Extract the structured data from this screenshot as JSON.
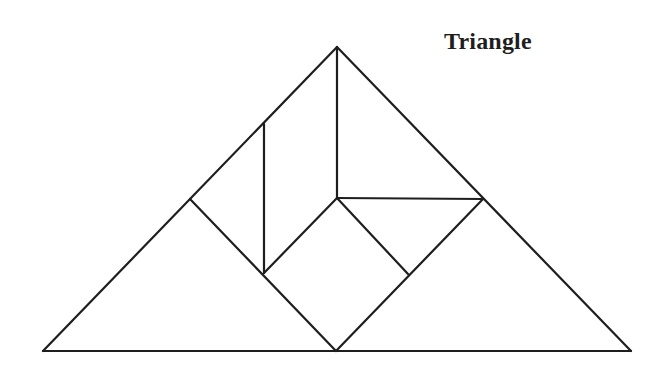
{
  "title": "Triangle",
  "diagram": {
    "type": "tangram",
    "stroke_color": "#1e1e1e",
    "background": "#ffffff",
    "vertices": {
      "apex": [
        337,
        47
      ],
      "bottom_left": [
        43,
        351
      ],
      "bottom_right": [
        631,
        351
      ],
      "bottom_mid": [
        336,
        351
      ],
      "left_mid": [
        190,
        199
      ],
      "right_mid": [
        483,
        199
      ],
      "center": [
        337,
        198
      ],
      "vert_top": [
        264,
        124
      ],
      "vert_bottom": [
        264,
        273
      ],
      "square_right": [
        408,
        274
      ]
    },
    "segments": [
      {
        "name": "outer-left-edge",
        "from": [
          43,
          351
        ],
        "to": [
          337,
          47
        ]
      },
      {
        "name": "outer-right-edge",
        "from": [
          337,
          47
        ],
        "to": [
          631,
          351
        ]
      },
      {
        "name": "outer-base",
        "from": [
          43,
          351
        ],
        "to": [
          631,
          351
        ]
      },
      {
        "name": "central-vertical",
        "from": [
          337,
          47
        ],
        "to": [
          337,
          198
        ]
      },
      {
        "name": "left-vertical",
        "from": [
          264,
          124
        ],
        "to": [
          264,
          273
        ]
      },
      {
        "name": "left-diagonal",
        "from": [
          190,
          199
        ],
        "to": [
          336,
          351
        ]
      },
      {
        "name": "inner-diagonal-up",
        "from": [
          264,
          273
        ],
        "to": [
          337,
          198
        ]
      },
      {
        "name": "horizontal-shelf",
        "from": [
          337,
          198
        ],
        "to": [
          483,
          199
        ]
      },
      {
        "name": "square-upper-right",
        "from": [
          337,
          198
        ],
        "to": [
          408,
          274
        ]
      },
      {
        "name": "right-diagonal",
        "from": [
          483,
          199
        ],
        "to": [
          336,
          351
        ]
      }
    ],
    "pieces": [
      {
        "name": "large-triangle-left",
        "points": [
          [
            43,
            351
          ],
          [
            190,
            199
          ],
          [
            336,
            351
          ]
        ]
      },
      {
        "name": "large-triangle-right",
        "points": [
          [
            483,
            199
          ],
          [
            631,
            351
          ],
          [
            336,
            351
          ]
        ]
      },
      {
        "name": "medium-triangle-top",
        "points": [
          [
            337,
            47
          ],
          [
            337,
            198
          ],
          [
            483,
            199
          ]
        ]
      },
      {
        "name": "parallelogram-left",
        "points": [
          [
            190,
            199
          ],
          [
            264,
            124
          ],
          [
            264,
            273
          ]
        ]
      },
      {
        "name": "parallelogram-upper",
        "points": [
          [
            264,
            124
          ],
          [
            337,
            47
          ],
          [
            337,
            198
          ],
          [
            264,
            273
          ]
        ]
      },
      {
        "name": "square-center",
        "points": [
          [
            264,
            273
          ],
          [
            337,
            198
          ],
          [
            408,
            274
          ],
          [
            336,
            351
          ]
        ]
      },
      {
        "name": "small-triangle-right",
        "points": [
          [
            337,
            198
          ],
          [
            483,
            199
          ],
          [
            408,
            274
          ]
        ]
      }
    ]
  }
}
